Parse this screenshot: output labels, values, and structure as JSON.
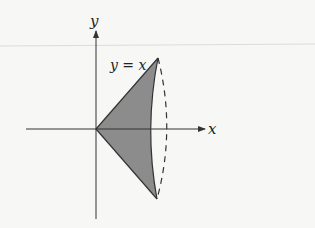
{
  "diagram": {
    "axes": {
      "x_label": "x",
      "y_label": "y"
    },
    "curve_label": "y = x",
    "region": {
      "description": "Triangle region bounded by y = x and y = -x, rotated about the x-axis to form a cone",
      "fill_color": "#8c8c8c",
      "edge_color": "#333333"
    },
    "rotation_ellipse": {
      "style": "dashed"
    }
  }
}
